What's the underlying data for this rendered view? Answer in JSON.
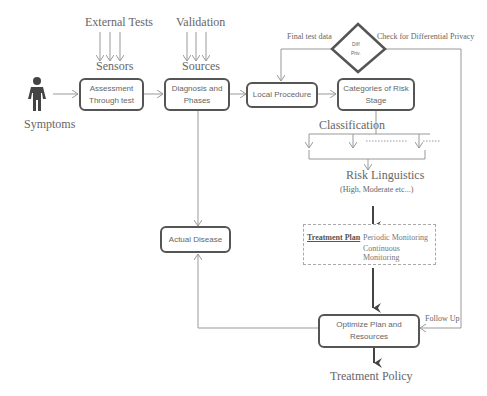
{
  "diagram": {
    "inputs": {
      "external_tests": "External Tests",
      "sensors": "Sensors",
      "validation": "Validation",
      "sources": "Sources"
    },
    "actor": {
      "label": "Symptoms",
      "icon": "person-icon"
    },
    "nodes": {
      "assessment": {
        "line1": "Assessment",
        "line2": "Through test"
      },
      "diagnosis": {
        "line1": "Diagnosis and",
        "line2": "Phases"
      },
      "local_procedure": "Local Procedure",
      "categories": {
        "line1": "Categories of Risk",
        "line2": "Stage"
      },
      "actual_disease": "Actual Disease",
      "optimize": {
        "line1": "Optimize Plan and",
        "line2": "Resources"
      },
      "decision": {
        "line1": "Diff",
        "line2": "Priv."
      }
    },
    "edge_labels": {
      "final_test_data": "Final test data",
      "check_dp": "Check for Differential Privacy",
      "follow_up": "Follow Up"
    },
    "classification": "Classification",
    "risk_linguistics": "Risk Linguistics",
    "risk_levels": "(High, Moderate etc...)",
    "treatment_plan": {
      "title": "Treatment Plan",
      "separator": ":",
      "item1": "Periodic Monitoring",
      "item2": "Continuous Monitoring"
    },
    "output": "Treatment Policy"
  }
}
